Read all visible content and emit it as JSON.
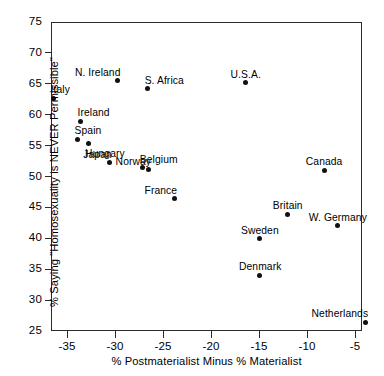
{
  "chart_data": {
    "type": "scatter",
    "title": "",
    "xlabel": "% Postmaterialist Minus % Materialist",
    "ylabel": "% Saying \"Homosexuality is NEVER Permissible\"",
    "xlim": [
      -38,
      -3.3
    ],
    "ylim": [
      25,
      75
    ],
    "xticks": [
      -35,
      -30,
      -25,
      -20,
      -15,
      -10,
      -5
    ],
    "xtick_labels": [
      "-35",
      "-30",
      "-25",
      "-20",
      "-15",
      "-10",
      "-5"
    ],
    "yticks": [
      25,
      30,
      35,
      40,
      45,
      50,
      55,
      60,
      65,
      70,
      75
    ],
    "ytick_labels": [
      "25",
      "30",
      "35",
      "40",
      "45",
      "50",
      "55",
      "60",
      "65",
      "70",
      "75"
    ],
    "grid": false,
    "legend": null,
    "points": [
      {
        "label": "Italy",
        "x": -36.4,
        "y": 62.7,
        "label_pos": "above-right"
      },
      {
        "label": "Ireland",
        "x": -33.6,
        "y": 58.9,
        "label_pos": "above-right"
      },
      {
        "label": "Spain",
        "x": -33.9,
        "y": 56.0,
        "label_pos": "above-right"
      },
      {
        "label": "Hungary",
        "x": -32.8,
        "y": 55.3,
        "label_pos": "below-right"
      },
      {
        "label": "Japan",
        "x": -30.6,
        "y": 52.2,
        "label_pos": "above-left"
      },
      {
        "label": "Belgium",
        "x": -27.1,
        "y": 51.4,
        "label_pos": "above-right"
      },
      {
        "label": "N. Ireland",
        "x": -29.7,
        "y": 65.5,
        "label_pos": "above-left"
      },
      {
        "label": "S. Africa",
        "x": -26.6,
        "y": 64.2,
        "label_pos": "above-right"
      },
      {
        "label": "U.S.A.",
        "x": -16.4,
        "y": 65.2,
        "label_pos": "above-center"
      },
      {
        "label": "Norway",
        "x": -26.5,
        "y": 51.1,
        "label_pos": "above-left"
      },
      {
        "label": "France",
        "x": -23.8,
        "y": 46.4,
        "label_pos": "above-left"
      },
      {
        "label": "Canada",
        "x": -8.2,
        "y": 51.0,
        "label_pos": "above-center"
      },
      {
        "label": "Britain",
        "x": -12.0,
        "y": 43.9,
        "label_pos": "above-center"
      },
      {
        "label": "W. Germany",
        "x": -6.8,
        "y": 42.0,
        "label_pos": "above-center"
      },
      {
        "label": "Sweden",
        "x": -14.9,
        "y": 39.9,
        "label_pos": "above-center"
      },
      {
        "label": "Denmark",
        "x": -14.9,
        "y": 34.0,
        "label_pos": "above-center"
      },
      {
        "label": "Netherlands",
        "x": -3.9,
        "y": 26.4,
        "label_pos": "above-left"
      }
    ]
  }
}
